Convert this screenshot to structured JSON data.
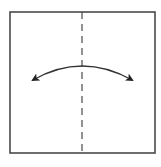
{
  "diagram": {
    "type": "origami-fold-step",
    "description": "Valley fold in half vertically and unfold",
    "paper": {
      "shape": "square",
      "x": 10,
      "y": 12,
      "width": 145,
      "height": 141,
      "stroke": "#4a4a4a",
      "fill": "#ffffff"
    },
    "fold_line": {
      "style": "dashed",
      "orientation": "vertical",
      "x": 82,
      "y1": 12,
      "y2": 153,
      "stroke": "#4a4a4a",
      "dash": "7 5"
    },
    "arrow": {
      "type": "curved-double-headed",
      "start": [
        33,
        80
      ],
      "control": [
        82,
        52
      ],
      "end": [
        132,
        80
      ],
      "stroke": "#333333",
      "head_color": "#222222"
    },
    "colors": {
      "background": "#ffffff",
      "line": "#4a4a4a"
    }
  }
}
